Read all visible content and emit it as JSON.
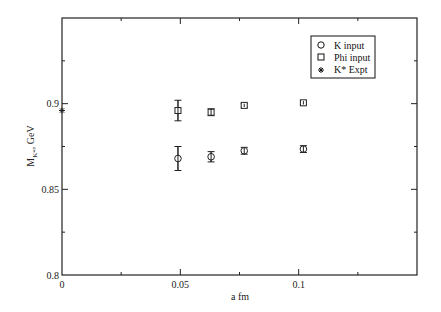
{
  "chart_data": {
    "type": "scatter",
    "title": "",
    "xlabel": "a fm",
    "ylabel": "M_K*, GeV",
    "ylabel_main": "M",
    "ylabel_sub": "K*",
    "ylabel_rest": ", GeV",
    "xlim": [
      0,
      0.15
    ],
    "ylim": [
      0.8,
      0.95
    ],
    "grid": false,
    "legend_position": "upper right",
    "x_ticks": [
      0,
      0.05,
      0.1
    ],
    "x_tick_labels": [
      "0",
      "0.05",
      "0.1"
    ],
    "x_minor_ticks": [
      0.025,
      0.075,
      0.125
    ],
    "y_ticks": [
      0.8,
      0.85,
      0.9
    ],
    "y_tick_labels": [
      "0.8",
      "0.85",
      "0.9"
    ],
    "y_minor_ticks": [
      0.825,
      0.875,
      0.925
    ],
    "series": [
      {
        "name": "K input",
        "marker": "circle",
        "x": [
          0.049,
          0.063,
          0.077,
          0.102
        ],
        "y": [
          0.868,
          0.869,
          0.8725,
          0.8735
        ],
        "yerr": [
          0.007,
          0.003,
          0.002,
          0.002
        ]
      },
      {
        "name": "Phi input",
        "marker": "square",
        "x": [
          0.049,
          0.063,
          0.077,
          0.102
        ],
        "y": [
          0.896,
          0.895,
          0.899,
          0.9005
        ],
        "yerr": [
          0.006,
          0.002,
          0.001,
          0.001
        ]
      },
      {
        "name": "K* Expt",
        "marker": "star",
        "x": [
          0
        ],
        "y": [
          0.896
        ],
        "yerr": [
          0
        ]
      }
    ]
  },
  "legend": {
    "items": [
      {
        "label": "K input",
        "symbol": "○"
      },
      {
        "label": "Phi input",
        "symbol": "□"
      },
      {
        "label": "K* Expt",
        "symbol": "✱"
      }
    ]
  }
}
